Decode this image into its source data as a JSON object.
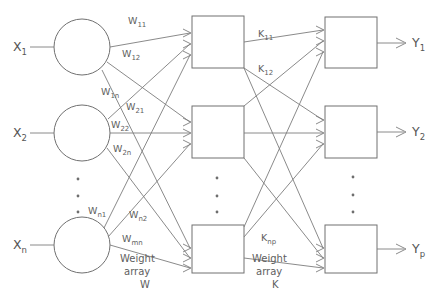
{
  "diagram": {
    "colors": {
      "line": "#7d7d7d",
      "shape": "#707070",
      "text": "#555555",
      "background": "#ffffff"
    },
    "inputs": [
      {
        "base": "X",
        "sub": "1"
      },
      {
        "base": "X",
        "sub": "2"
      },
      {
        "base": "X",
        "sub": "n"
      }
    ],
    "outputs": [
      {
        "base": "Y",
        "sub": "1"
      },
      {
        "base": "Y",
        "sub": "2"
      },
      {
        "base": "Y",
        "sub": "p"
      }
    ],
    "w_labels": [
      {
        "base": "W",
        "sub": "11"
      },
      {
        "base": "W",
        "sub": "12"
      },
      {
        "base": "W",
        "sub": "1n"
      },
      {
        "base": "W",
        "sub": "21"
      },
      {
        "base": "W",
        "sub": "22"
      },
      {
        "base": "W",
        "sub": "2n"
      },
      {
        "base": "W",
        "sub": "n1"
      },
      {
        "base": "W",
        "sub": "n2"
      },
      {
        "base": "W",
        "sub": "mn"
      }
    ],
    "k_labels": [
      {
        "base": "K",
        "sub": "11"
      },
      {
        "base": "K",
        "sub": "12"
      },
      {
        "base": "K",
        "sub": "np"
      }
    ],
    "captions": [
      {
        "line1": "Weight",
        "line2": "array",
        "line3": "W"
      },
      {
        "line1": "Weight",
        "line2": "array",
        "line3": "K"
      }
    ],
    "ellipsis_glyph": "•"
  }
}
